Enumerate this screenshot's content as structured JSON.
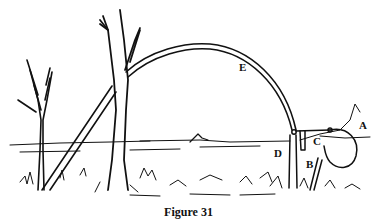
{
  "figure": {
    "caption": "Figure 31",
    "labels": [
      {
        "id": "A",
        "text": "A"
      },
      {
        "id": "B",
        "text": "B"
      },
      {
        "id": "C",
        "text": "C"
      },
      {
        "id": "D",
        "text": "D"
      },
      {
        "id": "E",
        "text": "E"
      }
    ],
    "colors": {
      "ink": "#111111",
      "background": "#ffffff"
    }
  }
}
